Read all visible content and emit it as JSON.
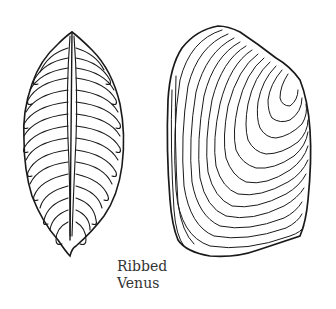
{
  "caption": {
    "line1": "Ribbed",
    "line2": "Venus"
  },
  "illustration": {
    "subject": "ribbed-venus-shell",
    "views": [
      "side-hinge-view",
      "valve-exterior-view"
    ],
    "stroke_color": "#1a1a1a",
    "background": "#ffffff"
  }
}
